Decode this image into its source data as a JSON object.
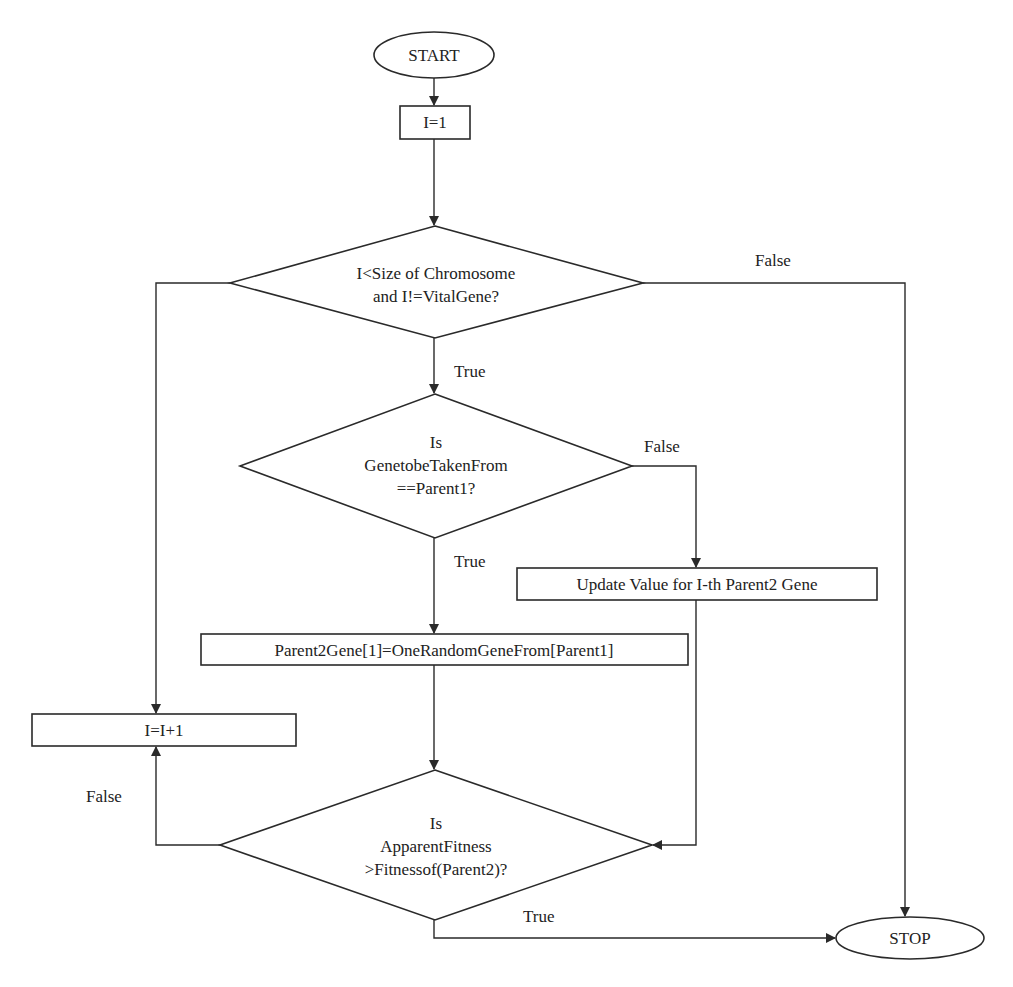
{
  "diagram": {
    "type": "flowchart",
    "nodes": {
      "start": {
        "shape": "ellipse",
        "label": "START"
      },
      "init": {
        "shape": "rect",
        "label": "I=1"
      },
      "cond1": {
        "shape": "diamond",
        "lines": [
          "I<Size of Chromosome",
          "and I!=VitalGene?"
        ]
      },
      "cond2": {
        "shape": "diamond",
        "lines": [
          "Is",
          "GenetobeTakenFrom",
          "==Parent1?"
        ]
      },
      "update": {
        "shape": "rect",
        "label": "Update Value for I-th Parent2 Gene"
      },
      "assign": {
        "shape": "rect",
        "label": "Parent2Gene[1]=OneRandomGeneFrom[Parent1]"
      },
      "increment": {
        "shape": "rect",
        "label": "I=I+1"
      },
      "cond3": {
        "shape": "diamond",
        "lines": [
          "Is",
          "ApparentFitness",
          ">Fitnessof(Parent2)?"
        ]
      },
      "stop": {
        "shape": "ellipse",
        "label": "STOP"
      }
    },
    "edge_labels": {
      "cond1_false": "False",
      "cond1_true": "True",
      "cond2_false": "False",
      "cond2_true": "True",
      "cond3_false": "False",
      "cond3_true": "True"
    },
    "edges": [
      {
        "from": "start",
        "to": "init"
      },
      {
        "from": "init",
        "to": "cond1"
      },
      {
        "from": "cond1",
        "to": "cond2",
        "label": "True"
      },
      {
        "from": "cond1",
        "to": "stop",
        "label": "False"
      },
      {
        "from": "cond1",
        "to": "increment"
      },
      {
        "from": "cond2",
        "to": "assign",
        "label": "True"
      },
      {
        "from": "cond2",
        "to": "update",
        "label": "False"
      },
      {
        "from": "assign",
        "to": "cond3"
      },
      {
        "from": "update",
        "to": "cond3"
      },
      {
        "from": "cond3",
        "to": "increment",
        "label": "False"
      },
      {
        "from": "cond3",
        "to": "stop",
        "label": "True"
      }
    ]
  }
}
